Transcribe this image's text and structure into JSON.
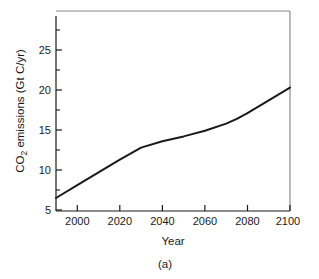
{
  "chart_data": {
    "type": "line",
    "title": "",
    "xlabel": "Year",
    "ylabel": "CO2 emissions (Gt C/yr)",
    "ylabel_prefix": "CO",
    "ylabel_subscript": "2",
    "ylabel_suffix": " emissions (Gt C/yr)",
    "panel_caption": "(a)",
    "xlim": [
      1990,
      2100
    ],
    "ylim": [
      4.5,
      28.5
    ],
    "grid": false,
    "legend": null,
    "xticks": [
      2000,
      2020,
      2040,
      2060,
      2080,
      2100
    ],
    "xtick_labels": [
      "2000",
      "2020",
      "2040",
      "2060",
      "2080",
      "2100"
    ],
    "yticks": [
      5,
      10,
      15,
      20,
      25
    ],
    "ytick_labels": [
      "5",
      "10",
      "15",
      "20",
      "25"
    ],
    "yticks_minor": [
      7.5,
      12.5,
      17.5,
      22.5,
      27.5
    ],
    "line_color": "#1a1a1a",
    "line_width": 2.0,
    "series": [
      {
        "name": "CO2 emissions",
        "x": [
          1990,
          2000,
          2010,
          2020,
          2030,
          2040,
          2050,
          2060,
          2070,
          2075,
          2080,
          2090,
          2100
        ],
        "y": [
          6.5,
          8.1,
          9.7,
          11.3,
          12.8,
          13.6,
          14.2,
          14.9,
          15.8,
          16.4,
          17.1,
          18.7,
          20.3
        ]
      }
    ]
  }
}
